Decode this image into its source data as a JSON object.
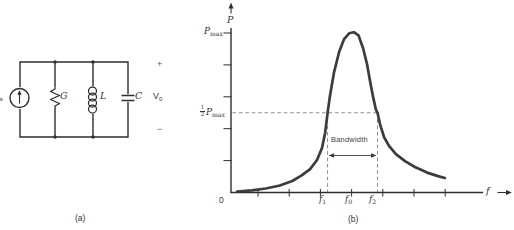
{
  "colors": {
    "ink": "#2e2e2e",
    "curve": "#3c3c3c",
    "dashed": "#8c8c8c",
    "text": "#333333",
    "background": "#ffffff"
  },
  "figure": {
    "panel_a": {
      "caption": "(a)",
      "source_label": {
        "base": "I",
        "sub": "s"
      },
      "conductance_label": "G",
      "inductor_label": "L",
      "capacitor_label": "C",
      "voltage_label": {
        "base": "V",
        "sub": "0"
      },
      "plus_sign": "+",
      "minus_sign": "−"
    },
    "panel_b": {
      "caption": "(b)",
      "y_axis_label": "P",
      "x_axis_label": "f",
      "origin_label": "0",
      "p_max_label": {
        "base": "P",
        "sub": "max"
      },
      "half_p_max_label": {
        "frac_num": "1",
        "frac_den": "2",
        "base": "P",
        "sub": "max"
      },
      "bandwidth_label": "Bandwidth",
      "f1_label": {
        "base": "f",
        "sub": "1"
      },
      "f0_label": {
        "base": "f",
        "sub": "0"
      },
      "f2_label": {
        "base": "f",
        "sub": "2"
      }
    }
  },
  "chart_data": {
    "type": "line",
    "title": "",
    "xlabel": "f",
    "ylabel": "P",
    "x_unit": "axis tick units (ticks unlabeled)",
    "y_unit": "fraction of P_max",
    "x_ticks": [
      1,
      2,
      3,
      4,
      5,
      6,
      7
    ],
    "y_ticks": [
      0.2,
      0.4,
      0.6,
      0.8,
      1.0
    ],
    "f0": 4.0,
    "f1": 3.23,
    "f2": 4.83,
    "half_power_level": 0.5,
    "p_max_level": 1.0,
    "grid": false,
    "annotations": [
      "P_max",
      "1/2 P_max",
      "Bandwidth",
      "f_1",
      "f_0",
      "f_2"
    ],
    "curve": {
      "x": [
        0.33,
        0.8,
        1.25,
        1.7,
        2.1,
        2.4,
        2.67,
        2.89,
        3.05,
        3.15,
        3.23,
        3.31,
        3.44,
        3.6,
        3.76,
        3.92,
        4.07,
        4.22,
        4.37,
        4.5,
        4.6,
        4.7,
        4.78,
        4.83,
        4.91,
        5.04,
        5.2,
        5.42,
        5.71,
        6.03,
        6.42,
        6.77,
        6.99
      ],
      "y": [
        0.006,
        0.013,
        0.025,
        0.044,
        0.072,
        0.107,
        0.147,
        0.204,
        0.279,
        0.373,
        0.5,
        0.611,
        0.755,
        0.881,
        0.962,
        0.998,
        1.005,
        0.985,
        0.905,
        0.8,
        0.69,
        0.59,
        0.52,
        0.5,
        0.429,
        0.348,
        0.292,
        0.241,
        0.197,
        0.16,
        0.125,
        0.103,
        0.091
      ]
    }
  }
}
